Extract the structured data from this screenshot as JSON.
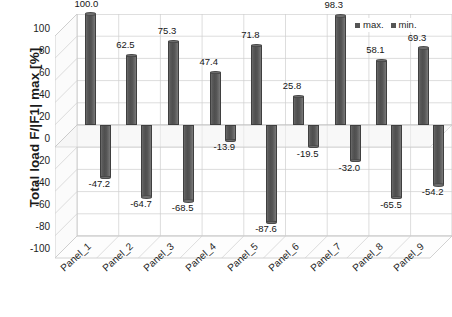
{
  "chart_data": {
    "type": "bar",
    "title": "",
    "xlabel": "",
    "ylabel": "Total load F/|F1| max [%]",
    "ylim": [
      -100,
      100
    ],
    "yticks": [
      100,
      80,
      60,
      40,
      20,
      0,
      -20,
      -40,
      -60,
      -80,
      -100
    ],
    "grid": true,
    "legend_position": "top-right",
    "projection": "3d",
    "categories": [
      "Panel_1",
      "Panel_2",
      "Panel_3",
      "Panel_4",
      "Panel_5",
      "Panel_6",
      "Panel_7",
      "Panel_8",
      "Panel_9"
    ],
    "series": [
      {
        "name": "max.",
        "color": "#555555",
        "values": [
          100.0,
          62.5,
          75.3,
          47.4,
          71.8,
          25.8,
          98.3,
          58.1,
          69.3
        ],
        "labels": [
          "100.0",
          "62.5",
          "75.3",
          "47.4",
          "71.8",
          "25.8",
          "98.3",
          "58.1",
          "69.3"
        ]
      },
      {
        "name": "min.",
        "color": "#555555",
        "values": [
          -47.2,
          -64.7,
          -68.5,
          -13.9,
          -87.6,
          -19.5,
          -32.0,
          -65.5,
          -54.2
        ],
        "labels": [
          "-47.2",
          "-64.7",
          "-68.5",
          "-13.9",
          "-87.6",
          "-19.5",
          "-32.0",
          "-65.5",
          "-54.2"
        ]
      }
    ]
  },
  "legend": {
    "items": [
      {
        "label": "max."
      },
      {
        "label": "min."
      }
    ]
  },
  "axis": {
    "y_title": "Total load F/|F1| max [%]"
  }
}
